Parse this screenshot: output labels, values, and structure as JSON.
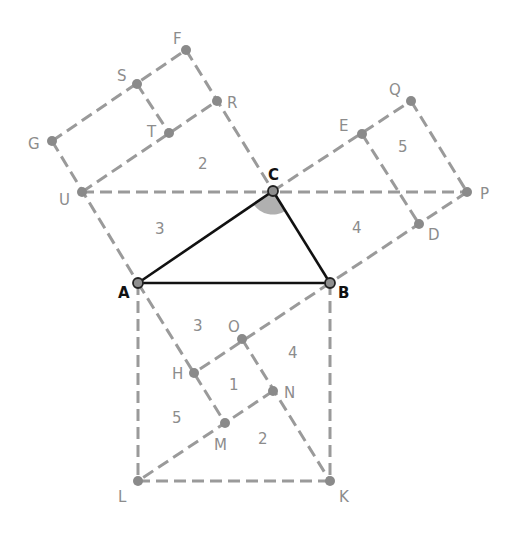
{
  "diagram": {
    "colors": {
      "dashed": "#9a9a9a",
      "triangle": "#111111",
      "point": "#8a8a8a",
      "angle_fill": "#b0b0b0",
      "label_gray": "#8c8c8c",
      "label_main": "#111111"
    },
    "points": {
      "A": {
        "label": "A",
        "x": 138,
        "y": 283
      },
      "B": {
        "label": "B",
        "x": 330,
        "y": 283
      },
      "C": {
        "label": "C",
        "x": 273,
        "y": 191
      },
      "F": {
        "label": "F",
        "x": 186,
        "y": 50
      },
      "S": {
        "label": "S",
        "x": 137,
        "y": 84
      },
      "R": {
        "label": "R",
        "x": 217,
        "y": 101
      },
      "T": {
        "label": "T",
        "x": 169,
        "y": 133
      },
      "G": {
        "label": "G",
        "x": 52,
        "y": 141
      },
      "U": {
        "label": "U",
        "x": 82,
        "y": 192
      },
      "Q": {
        "label": "Q",
        "x": 411,
        "y": 101
      },
      "E": {
        "label": "E",
        "x": 362,
        "y": 134
      },
      "P": {
        "label": "P",
        "x": 467,
        "y": 192
      },
      "D": {
        "label": "D",
        "x": 419,
        "y": 224
      },
      "O": {
        "label": "O",
        "x": 242,
        "y": 339
      },
      "H": {
        "label": "H",
        "x": 194,
        "y": 373
      },
      "N": {
        "label": "N",
        "x": 273,
        "y": 391
      },
      "M": {
        "label": "M",
        "x": 225,
        "y": 423
      },
      "L": {
        "label": "L",
        "x": 138,
        "y": 481
      },
      "K": {
        "label": "K",
        "x": 330,
        "y": 481
      }
    },
    "triangle": [
      "A",
      "B",
      "C"
    ],
    "right_angle_at": "C",
    "region_numbers": [
      {
        "text": "2",
        "x": 203,
        "y": 164
      },
      {
        "text": "3",
        "x": 160,
        "y": 229
      },
      {
        "text": "5",
        "x": 403,
        "y": 147
      },
      {
        "text": "4",
        "x": 357,
        "y": 228
      },
      {
        "text": "3",
        "x": 198,
        "y": 326
      },
      {
        "text": "4",
        "x": 293,
        "y": 353
      },
      {
        "text": "1",
        "x": 234,
        "y": 385
      },
      {
        "text": "5",
        "x": 177,
        "y": 418
      },
      {
        "text": "2",
        "x": 263,
        "y": 439
      }
    ]
  }
}
